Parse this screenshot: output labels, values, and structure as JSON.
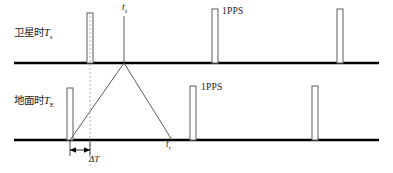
{
  "figure": {
    "type": "timing-diagram",
    "colors": {
      "timeline": "#000000",
      "pulse_outline": "#6b6b6b",
      "signal_path": "#4a4a4a",
      "dashed_reference": "#b0b0b0",
      "text": "#1a1a1a"
    },
    "timelines": [
      {
        "id": "satellite",
        "label_cn": "卫星时",
        "label_symbol": "T",
        "label_subscript": "s",
        "y": 63,
        "pulse_x": [
          90,
          215,
          340
        ],
        "pps_label": "1PPS"
      },
      {
        "id": "ground",
        "label_cn": "地面时",
        "label_symbol": "T",
        "label_subscript": "E",
        "y": 140,
        "pulse_x": [
          70,
          193,
          315
        ],
        "pps_label": "1PPS"
      }
    ],
    "annotations": {
      "ts_symbol": "t",
      "ts_subscript": "s",
      "tr_symbol": "t",
      "tr_subscript": "r",
      "delta_symbol": "Δ",
      "delta_subscript": "T",
      "delta_t_from_x": 70,
      "delta_t_to_x": 90
    },
    "signal_path": {
      "start_x": 70,
      "apex_x": 124,
      "end_x": 172
    }
  }
}
